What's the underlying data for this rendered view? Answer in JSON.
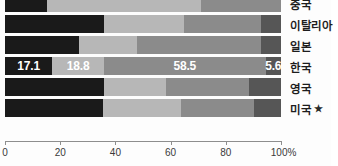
{
  "chart_data": {
    "type": "bar",
    "orientation": "horizontal",
    "stacked": true,
    "normalized_percent": true,
    "title": "",
    "xlabel": "",
    "ylabel": "",
    "xlim": [
      0,
      100
    ],
    "grid": false,
    "legend_position": "none",
    "axis_unit_suffix": "%",
    "categories": [
      "중국",
      "이탈리아",
      "일본",
      "한국",
      "영국",
      "미국 ★"
    ],
    "tick_labels": [
      "0",
      "20",
      "40",
      "60",
      "80",
      "100%"
    ],
    "tick_values": [
      0,
      20,
      40,
      60,
      80,
      100
    ],
    "series": [
      {
        "name": "segment-1",
        "color": "#1a1a1a",
        "values": [
          15.2,
          35.8,
          26.8,
          17.1,
          35.9,
          35.6
        ]
      },
      {
        "name": "segment-2",
        "color": "#b7b7b7",
        "values": [
          55.9,
          29.0,
          21.0,
          18.8,
          22.4,
          28.3
        ]
      },
      {
        "name": "segment-3",
        "color": "#8b8b8b",
        "values": [
          28.9,
          28.1,
          44.9,
          58.5,
          30.0,
          26.4
        ]
      },
      {
        "name": "segment-4",
        "color": "#565656",
        "values": [
          0.0,
          7.1,
          7.3,
          5.6,
          11.7,
          9.7
        ]
      }
    ],
    "labeled_row": "한국",
    "labeled_values": [
      "17.1",
      "18.8",
      "58.5",
      "5.6"
    ],
    "rows": [
      {
        "category": "중국",
        "marked": false,
        "segments": [
          {
            "value": 15.2,
            "label": "",
            "color_key": "seg-0"
          },
          {
            "value": 55.9,
            "label": "",
            "color_key": "seg-1"
          },
          {
            "value": 28.9,
            "label": "",
            "color_key": "seg-2"
          },
          {
            "value": 0.0,
            "label": "",
            "color_key": "seg-3"
          }
        ]
      },
      {
        "category": "이탈리아",
        "marked": false,
        "segments": [
          {
            "value": 35.8,
            "label": "",
            "color_key": "seg-0"
          },
          {
            "value": 29.0,
            "label": "",
            "color_key": "seg-1"
          },
          {
            "value": 28.1,
            "label": "",
            "color_key": "seg-2"
          },
          {
            "value": 7.1,
            "label": "",
            "color_key": "seg-3"
          }
        ]
      },
      {
        "category": "일본",
        "marked": false,
        "segments": [
          {
            "value": 26.8,
            "label": "",
            "color_key": "seg-0"
          },
          {
            "value": 21.0,
            "label": "",
            "color_key": "seg-1"
          },
          {
            "value": 44.9,
            "label": "",
            "color_key": "seg-2"
          },
          {
            "value": 7.3,
            "label": "",
            "color_key": "seg-3"
          }
        ]
      },
      {
        "category": "한국",
        "marked": false,
        "segments": [
          {
            "value": 17.1,
            "label": "17.1",
            "color_key": "seg-0"
          },
          {
            "value": 18.8,
            "label": "18.8",
            "color_key": "seg-1"
          },
          {
            "value": 58.5,
            "label": "58.5",
            "color_key": "seg-2"
          },
          {
            "value": 5.6,
            "label": "5.6",
            "color_key": "seg-3"
          }
        ]
      },
      {
        "category": "영국",
        "marked": false,
        "segments": [
          {
            "value": 35.9,
            "label": "",
            "color_key": "seg-0"
          },
          {
            "value": 22.4,
            "label": "",
            "color_key": "seg-1"
          },
          {
            "value": 30.0,
            "label": "",
            "color_key": "seg-2"
          },
          {
            "value": 11.7,
            "label": "",
            "color_key": "seg-3"
          }
        ]
      },
      {
        "category": "미국 ★",
        "marked": true,
        "segments": [
          {
            "value": 35.6,
            "label": "",
            "color_key": "seg-0"
          },
          {
            "value": 28.3,
            "label": "",
            "color_key": "seg-1"
          },
          {
            "value": 26.4,
            "label": "",
            "color_key": "seg-2"
          },
          {
            "value": 9.7,
            "label": "",
            "color_key": "seg-3"
          }
        ]
      }
    ]
  },
  "colors": {
    "segment_1": "#1a1a1a",
    "segment_2": "#b7b7b7",
    "segment_3": "#8b8b8b",
    "segment_4": "#565656",
    "axis": "#8e8e8e",
    "text": "#1d1d1d",
    "background": "#fdfdfd"
  }
}
